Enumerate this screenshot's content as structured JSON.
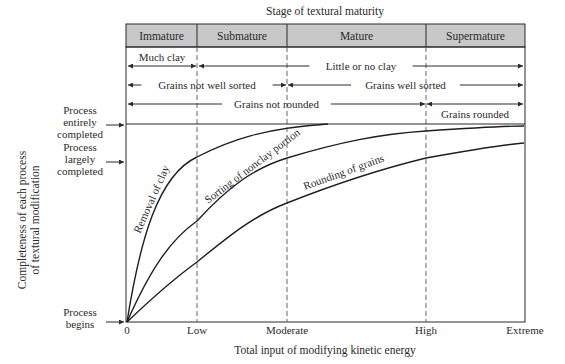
{
  "title": "Stage of textural maturity",
  "stages": [
    {
      "label": "Immature",
      "x0": 126,
      "x1": 197
    },
    {
      "label": "Submature",
      "x0": 197,
      "x1": 287
    },
    {
      "label": "Mature",
      "x0": 287,
      "x1": 426
    },
    {
      "label": "Supermature",
      "x0": 426,
      "x1": 525
    }
  ],
  "ranges": [
    {
      "label": "Much clay",
      "x0": 128,
      "x1": 196,
      "y": 66,
      "label_pos": "above"
    },
    {
      "label": "Little or no clay",
      "x0": 199,
      "x1": 523,
      "y": 66,
      "label_pos": "inline"
    },
    {
      "label": "Grains not well sorted",
      "x0": 128,
      "x1": 286,
      "y": 85,
      "label_pos": "inline"
    },
    {
      "label": "Grains well sorted",
      "x0": 288,
      "x1": 523,
      "y": 85,
      "label_pos": "inline"
    },
    {
      "label": "Grains not rounded",
      "x0": 128,
      "x1": 425,
      "y": 104,
      "label_pos": "inline"
    },
    {
      "label": "Grains rounded",
      "x0": 427,
      "x1": 523,
      "y": 104,
      "label_pos": "below"
    }
  ],
  "y_axis": {
    "label_line1": "Completeness of each process",
    "label_line2": "of textural modification",
    "levels": [
      {
        "label_lines": [
          "Process",
          "entirely",
          "completed"
        ],
        "y": 124
      },
      {
        "label_lines": [
          "Process",
          "largely",
          "completed"
        ],
        "y": 161
      },
      {
        "label_lines": [
          "Process",
          "begins"
        ],
        "y": 322
      }
    ]
  },
  "x_axis": {
    "label": "Total input of modifying kinetic energy",
    "ticks": [
      {
        "label": "0",
        "x": 127
      },
      {
        "label": "Low",
        "x": 197
      },
      {
        "label": "Moderate",
        "x": 287
      },
      {
        "label": "High",
        "x": 426
      },
      {
        "label": "Extreme",
        "x": 525
      }
    ]
  },
  "curves": [
    {
      "label": "Removal of clay",
      "path": "M127,322 C140,240 158,175 197,157 C230,140 265,128 328,124"
    },
    {
      "label": "Sorting of nonclay portion",
      "path": "M127,322 C150,270 170,240 197,221 C230,185 255,168 287,158 C340,142 380,134 426,131 C470,128 500,126 524,126"
    },
    {
      "label": "Rounding of grains",
      "path": "M127,322 C150,300 175,278 197,262 C230,235 255,215 287,203 C340,182 385,168 426,158 C470,150 500,145 524,143"
    }
  ],
  "chart_data": {
    "type": "line",
    "title": "Stage of textural maturity",
    "xlabel": "Total input of modifying kinetic energy",
    "ylabel": "Completeness of each process of textural modification",
    "x_categories": [
      "0",
      "Low",
      "Moderate",
      "High",
      "Extreme"
    ],
    "y_levels": [
      "Process begins",
      "Process largely completed",
      "Process entirely completed"
    ],
    "ylim": [
      0,
      1
    ],
    "stages": [
      "Immature",
      "Submature",
      "Mature",
      "Supermature"
    ],
    "series": [
      {
        "name": "Removal of clay",
        "x": [
          0,
          1,
          2,
          2.4
        ],
        "values": [
          0,
          0.84,
          0.99,
          1.0
        ]
      },
      {
        "name": "Sorting of nonclay portion",
        "x": [
          0,
          1,
          2,
          3,
          4
        ],
        "values": [
          0,
          0.51,
          0.83,
          0.96,
          0.98
        ]
      },
      {
        "name": "Rounding of grains",
        "x": [
          0,
          1,
          2,
          3,
          4
        ],
        "values": [
          0,
          0.3,
          0.6,
          0.83,
          0.9
        ]
      }
    ],
    "annotations": [
      "Much clay",
      "Little or no clay",
      "Grains not well sorted",
      "Grains well sorted",
      "Grains not rounded",
      "Grains rounded"
    ],
    "grid": false
  }
}
